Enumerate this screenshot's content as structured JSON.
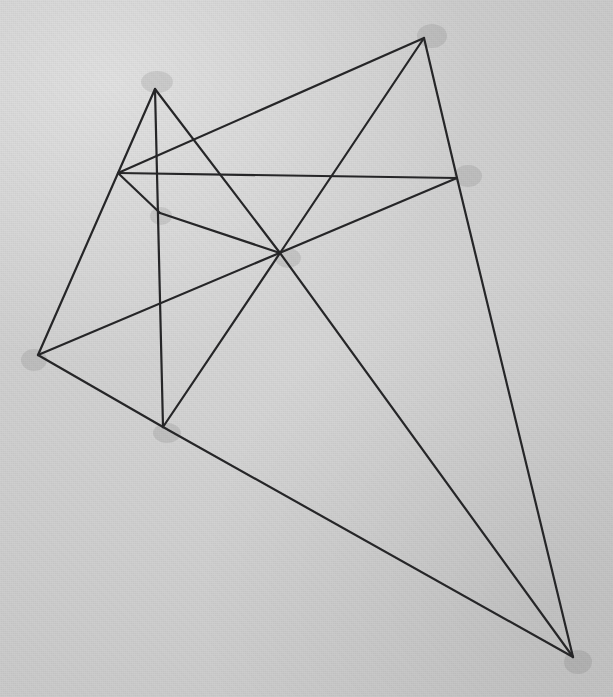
{
  "figure": {
    "medium": "pencil on gray paper",
    "background_color": "#d2d2d2",
    "line_color": "#262628",
    "line_width": 2.2,
    "canvas": {
      "width": 613,
      "height": 697
    },
    "vertices": [
      {
        "id": "A",
        "name": "apex-upper-left",
        "x": 155,
        "y": 89
      },
      {
        "id": "B",
        "name": "apex-upper-right",
        "x": 424,
        "y": 38
      },
      {
        "id": "C",
        "name": "node-left-upper",
        "x": 118,
        "y": 173
      },
      {
        "id": "D",
        "name": "node-right-upper",
        "x": 457,
        "y": 178
      },
      {
        "id": "E",
        "name": "node-center",
        "x": 280,
        "y": 253
      },
      {
        "id": "F",
        "name": "node-left-inner",
        "x": 160,
        "y": 213
      },
      {
        "id": "G",
        "name": "vertex-far-left",
        "x": 38,
        "y": 355
      },
      {
        "id": "H",
        "name": "vertex-lower-left",
        "x": 163,
        "y": 427
      },
      {
        "id": "I",
        "name": "vertex-far-right",
        "x": 573,
        "y": 657
      }
    ],
    "edges": [
      {
        "id": "e1",
        "name": "apex-to-far-left",
        "from": "A",
        "to": "G"
      },
      {
        "id": "e2",
        "name": "apex-to-node-center",
        "from": "A",
        "to": "E"
      },
      {
        "id": "e3",
        "name": "apex-to-lower-left",
        "from": "A",
        "to": "H"
      },
      {
        "id": "e4",
        "name": "upper-right-to-left-upper",
        "from": "B",
        "to": "C"
      },
      {
        "id": "e5",
        "name": "upper-right-to-center",
        "from": "B",
        "to": "E"
      },
      {
        "id": "e6",
        "name": "upper-right-to-right-upper",
        "from": "B",
        "to": "D"
      },
      {
        "id": "e7",
        "name": "horizontal-span",
        "from": "C",
        "to": "D"
      },
      {
        "id": "e8",
        "name": "left-upper-to-left-inner",
        "from": "C",
        "to": "F"
      },
      {
        "id": "e9",
        "name": "right-upper-to-far-right",
        "from": "D",
        "to": "I"
      },
      {
        "id": "e10",
        "name": "right-upper-to-far-left",
        "from": "D",
        "to": "G"
      },
      {
        "id": "e11",
        "name": "left-inner-to-center",
        "from": "F",
        "to": "E"
      },
      {
        "id": "e12",
        "name": "center-to-lower-left",
        "from": "E",
        "to": "H"
      },
      {
        "id": "e13",
        "name": "center-to-far-right",
        "from": "E",
        "to": "I"
      },
      {
        "id": "e14",
        "name": "far-left-to-lower-left",
        "from": "G",
        "to": "H"
      },
      {
        "id": "e15",
        "name": "lower-left-to-far-right",
        "from": "H",
        "to": "I"
      }
    ],
    "smudges": [
      {
        "name": "smudge-apex-upper-left",
        "cx": 157,
        "cy": 82,
        "rx": 16,
        "ry": 11
      },
      {
        "name": "smudge-apex-upper-right",
        "cx": 432,
        "cy": 36,
        "rx": 15,
        "ry": 12
      },
      {
        "name": "smudge-right-upper",
        "cx": 468,
        "cy": 176,
        "rx": 14,
        "ry": 11
      },
      {
        "name": "smudge-node-center",
        "cx": 288,
        "cy": 258,
        "rx": 13,
        "ry": 10
      },
      {
        "name": "smudge-far-left",
        "cx": 34,
        "cy": 360,
        "rx": 13,
        "ry": 11
      },
      {
        "name": "smudge-lower-left",
        "cx": 167,
        "cy": 433,
        "rx": 14,
        "ry": 10
      },
      {
        "name": "smudge-far-right",
        "cx": 578,
        "cy": 662,
        "rx": 14,
        "ry": 12
      },
      {
        "name": "smudge-left-inner",
        "cx": 161,
        "cy": 216,
        "rx": 11,
        "ry": 9
      }
    ]
  }
}
